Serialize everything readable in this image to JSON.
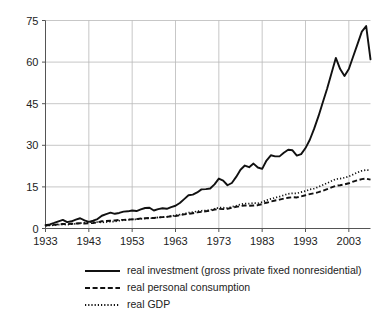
{
  "chart_data": {
    "type": "line",
    "title": "",
    "subtitle": "",
    "xlabel": "",
    "ylabel": "",
    "xlim": [
      1933,
      2008
    ],
    "ylim": [
      0,
      75
    ],
    "yticks": [
      0,
      15,
      30,
      45,
      60,
      75
    ],
    "xticks": [
      1933,
      1943,
      1953,
      1963,
      1973,
      1983,
      1993,
      2003
    ],
    "ytick_labels": [
      "0",
      "15",
      "30",
      "45",
      "60",
      "75"
    ],
    "xtick_labels": [
      "1933",
      "1943",
      "1953",
      "1963",
      "1973",
      "1983",
      "1993",
      "2003"
    ],
    "grid": "horizontal-and-vertical",
    "legend_position": "bottom",
    "x": [
      1933,
      1934,
      1935,
      1936,
      1937,
      1938,
      1939,
      1940,
      1941,
      1942,
      1943,
      1944,
      1945,
      1946,
      1947,
      1948,
      1949,
      1950,
      1951,
      1952,
      1953,
      1954,
      1955,
      1956,
      1957,
      1958,
      1959,
      1960,
      1961,
      1962,
      1963,
      1964,
      1965,
      1966,
      1967,
      1968,
      1969,
      1970,
      1971,
      1972,
      1973,
      1974,
      1975,
      1976,
      1977,
      1978,
      1979,
      1980,
      1981,
      1982,
      1983,
      1984,
      1985,
      1986,
      1987,
      1988,
      1989,
      1990,
      1991,
      1992,
      1993,
      1994,
      1995,
      1996,
      1997,
      1998,
      1999,
      2000,
      2001,
      2002,
      2003,
      2004,
      2005,
      2006,
      2007,
      2008
    ],
    "series": [
      {
        "name": "real investment (gross private fixed nonresidential)",
        "style": "solid",
        "values": [
          1.2,
          1.5,
          2.0,
          2.6,
          3.1,
          2.3,
          2.6,
          3.2,
          3.7,
          2.9,
          2.4,
          2.8,
          3.4,
          4.6,
          5.2,
          5.7,
          5.3,
          5.6,
          6.1,
          6.2,
          6.5,
          6.3,
          6.9,
          7.4,
          7.5,
          6.5,
          7.0,
          7.3,
          7.1,
          7.7,
          8.2,
          9.2,
          10.6,
          12.0,
          12.2,
          13.0,
          14.1,
          14.2,
          14.4,
          15.9,
          18.0,
          17.3,
          15.6,
          16.4,
          18.6,
          21.2,
          22.7,
          22.1,
          23.4,
          22.0,
          21.5,
          24.5,
          26.4,
          26.0,
          26.0,
          27.3,
          28.4,
          28.2,
          26.3,
          26.8,
          29.0,
          32.0,
          36.0,
          40.5,
          45.5,
          50.5,
          56.0,
          61.5,
          57.5,
          55.0,
          57.5,
          62.0,
          66.5,
          71.0,
          73.0,
          61.0
        ]
      },
      {
        "name": "real personal consumption",
        "style": "dashed",
        "values": [
          1.1,
          1.2,
          1.3,
          1.5,
          1.6,
          1.6,
          1.7,
          1.8,
          1.9,
          1.8,
          1.9,
          2.0,
          2.2,
          2.6,
          2.7,
          2.8,
          2.9,
          3.1,
          3.1,
          3.2,
          3.3,
          3.4,
          3.6,
          3.7,
          3.8,
          3.8,
          4.0,
          4.1,
          4.2,
          4.4,
          4.5,
          4.8,
          5.1,
          5.3,
          5.5,
          5.8,
          6.0,
          6.2,
          6.4,
          6.8,
          7.1,
          7.0,
          7.1,
          7.5,
          7.8,
          8.1,
          8.3,
          8.2,
          8.3,
          8.4,
          8.8,
          9.3,
          9.7,
          10.1,
          10.4,
          10.8,
          11.1,
          11.3,
          11.2,
          11.6,
          12.0,
          12.4,
          12.7,
          13.1,
          13.6,
          14.2,
          14.8,
          15.4,
          15.6,
          15.9,
          16.3,
          16.9,
          17.4,
          17.8,
          18.0,
          17.6
        ]
      },
      {
        "name": "real GDP",
        "style": "dotted",
        "values": [
          1.0,
          1.1,
          1.2,
          1.4,
          1.5,
          1.4,
          1.6,
          1.7,
          1.9,
          2.1,
          2.3,
          2.4,
          2.3,
          2.2,
          2.3,
          2.5,
          2.5,
          2.8,
          3.0,
          3.1,
          3.3,
          3.3,
          3.5,
          3.6,
          3.7,
          3.7,
          4.0,
          4.1,
          4.2,
          4.5,
          4.7,
          5.0,
          5.3,
          5.7,
          5.9,
          6.2,
          6.4,
          6.5,
          6.7,
          7.1,
          7.5,
          7.5,
          7.4,
          7.8,
          8.2,
          8.7,
          9.0,
          9.0,
          9.2,
          9.1,
          9.5,
          10.2,
          10.7,
          11.1,
          11.5,
          12.0,
          12.5,
          12.7,
          12.7,
          13.1,
          13.5,
          14.1,
          14.4,
          15.0,
          15.7,
          16.4,
          17.1,
          17.8,
          18.0,
          18.3,
          18.8,
          19.5,
          20.2,
          20.8,
          21.1,
          21.0
        ]
      }
    ]
  },
  "legend": {
    "items": [
      {
        "label": "real investment (gross private fixed nonresidential)",
        "style": "solid"
      },
      {
        "label": "real personal consumption",
        "style": "dashed"
      },
      {
        "label": "real GDP",
        "style": "dotted"
      }
    ]
  }
}
